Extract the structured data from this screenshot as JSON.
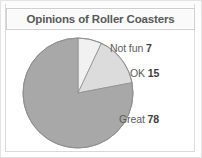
{
  "figure": {
    "title": "Opinions of Roller Coasters"
  },
  "chart_data": {
    "type": "pie",
    "title": "Opinions of Roller Coasters",
    "xlabel": "",
    "ylabel": "",
    "grid": false,
    "legend": "none",
    "labels_position": "outside-right",
    "start_angle_deg": 0,
    "direction": "clockwise",
    "total": 100,
    "units": "percent",
    "categories": [
      "Not fun",
      "OK",
      "Great"
    ],
    "values": [
      7,
      15,
      78
    ],
    "colors": [
      "#f1f1f1",
      "#dcdcdc",
      "#a8a8a8"
    ],
    "slices": [
      {
        "label": "Not fun",
        "value": 7,
        "value_text": "7",
        "color": "#f1f1f1",
        "angle_deg": 25.2
      },
      {
        "label": "OK",
        "value": 15,
        "value_text": "15",
        "color": "#dcdcdc",
        "angle_deg": 54.0
      },
      {
        "label": "Great",
        "value": 78,
        "value_text": "78",
        "color": "#a8a8a8",
        "angle_deg": 280.8
      }
    ],
    "geometry": {
      "center_x": 78,
      "center_y": 93,
      "radius": 55,
      "outline_color": "#8f8f8f"
    }
  }
}
